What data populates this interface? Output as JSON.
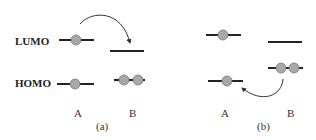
{
  "diagram": {
    "level_labels": {
      "lumo": "LUMO",
      "homo": "HOMO"
    },
    "colors": {
      "line": "#222222",
      "electron_fill": "#a8a8a8",
      "electron_stroke": "#777777",
      "arrow": "#333333"
    },
    "panels": [
      {
        "caption": "(a)",
        "molecule_labels": {
          "a": "A",
          "b": "B"
        },
        "description": "Electron transfer from LUMO of A to LUMO of B",
        "levels": [
          {
            "molecule": "A",
            "orbital": "LUMO",
            "electrons": 1
          },
          {
            "molecule": "A",
            "orbital": "HOMO",
            "electrons": 1
          },
          {
            "molecule": "B",
            "orbital": "LUMO",
            "electrons": 0
          },
          {
            "molecule": "B",
            "orbital": "HOMO",
            "electrons": 2
          }
        ],
        "arrow": {
          "from": "A LUMO",
          "to": "B LUMO"
        }
      },
      {
        "caption": "(b)",
        "molecule_labels": {
          "a": "A",
          "b": "B"
        },
        "description": "Electron transfer from HOMO of B to HOMO of A",
        "levels": [
          {
            "molecule": "A",
            "orbital": "LUMO",
            "electrons": 1
          },
          {
            "molecule": "A",
            "orbital": "HOMO",
            "electrons": 1
          },
          {
            "molecule": "B",
            "orbital": "LUMO",
            "electrons": 0
          },
          {
            "molecule": "B",
            "orbital": "HOMO",
            "electrons": 2
          }
        ],
        "arrow": {
          "from": "B HOMO",
          "to": "A HOMO"
        }
      }
    ]
  }
}
